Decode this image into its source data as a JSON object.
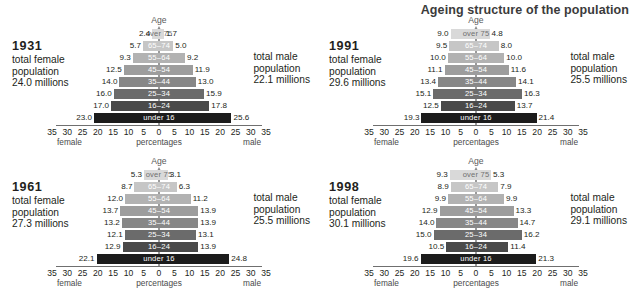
{
  "title": "Ageing structure of the population",
  "axis": {
    "age_label": "Age",
    "ticks": [
      "35",
      "30",
      "25",
      "20",
      "15",
      "10",
      "5",
      "0",
      "5",
      "10",
      "15",
      "20",
      "25",
      "30",
      "35"
    ],
    "left_label": "female",
    "center_label": "percentages",
    "right_label": "male",
    "max": 35
  },
  "labels": {
    "female_caption_1": "total female",
    "female_caption_2": "population",
    "male_caption_1": "total male",
    "male_caption_2": "population"
  },
  "age_groups": [
    "over 75",
    "65–74",
    "55–64",
    "45–54",
    "35–44",
    "25–34",
    "16–24",
    "under 16"
  ],
  "colors": {
    "bars": [
      "#d9d9d9",
      "#c6c6c6",
      "#b2b2b2",
      "#9d9d9d",
      "#878787",
      "#6b6b6b",
      "#4a4a4a",
      "#1c1c1c"
    ],
    "axis": "#6f6f6f",
    "center": "#9b9b9b",
    "title": "#3b3b3b",
    "text": "#231f20"
  },
  "panels": [
    {
      "year": "1931",
      "female_total": "24.0 millions",
      "male_total": "22.1 millions",
      "female": [
        "2.4",
        "5.7",
        "9.3",
        "12.5",
        "14.0",
        "16.0",
        "17.0",
        "23.0"
      ],
      "male": [
        "1.7",
        "5.0",
        "9.2",
        "11.9",
        "13.0",
        "15.9",
        "17.8",
        "25.6"
      ]
    },
    {
      "year": "1991",
      "female_total": "29.6 millions",
      "male_total": "25.5 millions",
      "female": [
        "9.0",
        "9.5",
        "10.0",
        "11.1",
        "13.4",
        "15.1",
        "12.5",
        "19.3"
      ],
      "male": [
        "4.8",
        "8.0",
        "10.0",
        "11.6",
        "14.1",
        "16.3",
        "13.7",
        "21.4"
      ]
    },
    {
      "year": "1961",
      "female_total": "27.3 millions",
      "male_total": "25.5 millions",
      "female": [
        "5.3",
        "8.7",
        "12.0",
        "13.7",
        "13.2",
        "12.1",
        "12.9",
        "22.1"
      ],
      "male": [
        "3.1",
        "6.3",
        "11.2",
        "13.9",
        "13.9",
        "13.1",
        "13.9",
        "24.8"
      ]
    },
    {
      "year": "1998",
      "female_total": "30.1 millions",
      "male_total": "29.1 millions",
      "female": [
        "9.3",
        "8.9",
        "9.9",
        "12.9",
        "14.0",
        "15.0",
        "10.5",
        "19.6"
      ],
      "male": [
        "5.3",
        "7.9",
        "9.9",
        "13.3",
        "14.7",
        "16.2",
        "11.4",
        "21.3"
      ]
    }
  ],
  "chart_data": {
    "type": "bar",
    "title": "Ageing structure of the population",
    "xlabel": "percentages",
    "ylabel": "Age",
    "xlim": [
      -35,
      35
    ],
    "grid": false,
    "legend": "none",
    "categories": [
      "over 75",
      "65–74",
      "55–64",
      "45–54",
      "35–44",
      "25–34",
      "16–24",
      "under 16"
    ],
    "panels": [
      {
        "name": "1931",
        "female_total_millions": 24.0,
        "male_total_millions": 22.1,
        "series": [
          {
            "name": "female",
            "values": [
              2.4,
              5.7,
              9.3,
              12.5,
              14.0,
              16.0,
              17.0,
              23.0
            ]
          },
          {
            "name": "male",
            "values": [
              1.7,
              5.0,
              9.2,
              11.9,
              13.0,
              15.9,
              17.8,
              25.6
            ]
          }
        ]
      },
      {
        "name": "1991",
        "female_total_millions": 29.6,
        "male_total_millions": 25.5,
        "series": [
          {
            "name": "female",
            "values": [
              9.0,
              9.5,
              10.0,
              11.1,
              13.4,
              15.1,
              12.5,
              19.3
            ]
          },
          {
            "name": "male",
            "values": [
              4.8,
              8.0,
              10.0,
              11.6,
              14.1,
              16.3,
              13.7,
              21.4
            ]
          }
        ]
      },
      {
        "name": "1961",
        "female_total_millions": 27.3,
        "male_total_millions": 25.5,
        "series": [
          {
            "name": "female",
            "values": [
              5.3,
              8.7,
              12.0,
              13.7,
              13.2,
              12.1,
              12.9,
              22.1
            ]
          },
          {
            "name": "male",
            "values": [
              3.1,
              6.3,
              11.2,
              13.9,
              13.9,
              13.1,
              13.9,
              24.8
            ]
          }
        ]
      },
      {
        "name": "1998",
        "female_total_millions": 30.1,
        "male_total_millions": 29.1,
        "series": [
          {
            "name": "female",
            "values": [
              9.3,
              8.9,
              9.9,
              12.9,
              14.0,
              15.0,
              10.5,
              19.6
            ]
          },
          {
            "name": "male",
            "values": [
              5.3,
              7.9,
              9.9,
              13.3,
              14.7,
              16.2,
              11.4,
              21.3
            ]
          }
        ]
      }
    ]
  }
}
